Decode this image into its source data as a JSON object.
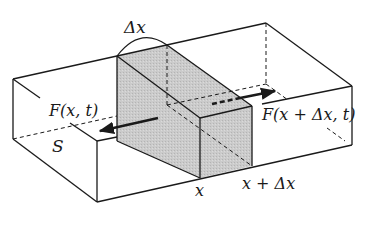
{
  "figure": {
    "colors": {
      "line": "#1a1a1a",
      "slice_fill": "#c8c8c8"
    }
  },
  "labels": {
    "delta_x": "Δx",
    "force_left": "F(x, t)",
    "force_right": "F(x + Δx, t)",
    "cross_section": "S",
    "x": "x",
    "x_plus_dx": "x + Δx"
  }
}
